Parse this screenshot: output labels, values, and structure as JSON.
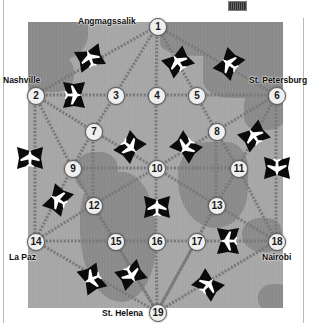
{
  "window": {
    "title": "Airline Route Network Map",
    "background_color": "#ffffff",
    "chip": {
      "name": "toolbar-chip",
      "color": "#4a4a4a"
    }
  },
  "map": {
    "name": "world-map-plate",
    "sea_color": "#9a9a9a",
    "land_color": "#8a8a8a",
    "x": 28,
    "y": 22,
    "width": 255,
    "height": 286
  },
  "graph": {
    "node_fill": "#efefef",
    "node_stroke": "#5d5d5d",
    "edge_color": "#787878",
    "nodes": [
      {
        "id": "1",
        "label": "1",
        "x": 157,
        "y": 26,
        "city": "Angmagssalik",
        "city_x": 78,
        "city_y": 16,
        "city_align": "left"
      },
      {
        "id": "2",
        "label": "2",
        "x": 35,
        "y": 95,
        "city": "Nashville",
        "city_x": 3,
        "city_y": 75,
        "city_align": "left"
      },
      {
        "id": "3",
        "label": "3",
        "x": 115,
        "y": 95,
        "city": "",
        "city_x": 0,
        "city_y": 0,
        "city_align": "left"
      },
      {
        "id": "4",
        "label": "4",
        "x": 156,
        "y": 95,
        "city": "",
        "city_x": 0,
        "city_y": 0,
        "city_align": "left"
      },
      {
        "id": "5",
        "label": "5",
        "x": 196,
        "y": 95,
        "city": "",
        "city_x": 0,
        "city_y": 0,
        "city_align": "left"
      },
      {
        "id": "6",
        "label": "6",
        "x": 276,
        "y": 95,
        "city": "St. Petersburg",
        "city_x": 249,
        "city_y": 75,
        "city_align": "left"
      },
      {
        "id": "7",
        "label": "7",
        "x": 93,
        "y": 131,
        "city": "",
        "city_x": 0,
        "city_y": 0,
        "city_align": "left"
      },
      {
        "id": "8",
        "label": "8",
        "x": 216,
        "y": 131,
        "city": "",
        "city_x": 0,
        "city_y": 0,
        "city_align": "left"
      },
      {
        "id": "9",
        "label": "9",
        "x": 72,
        "y": 168,
        "city": "",
        "city_x": 0,
        "city_y": 0,
        "city_align": "left"
      },
      {
        "id": "10",
        "label": "10",
        "x": 156,
        "y": 168,
        "city": "",
        "city_x": 0,
        "city_y": 0,
        "city_align": "left"
      },
      {
        "id": "11",
        "label": "11",
        "x": 238,
        "y": 168,
        "city": "",
        "city_x": 0,
        "city_y": 0,
        "city_align": "left"
      },
      {
        "id": "12",
        "label": "12",
        "x": 93,
        "y": 205,
        "city": "",
        "city_x": 0,
        "city_y": 0,
        "city_align": "left"
      },
      {
        "id": "13",
        "label": "13",
        "x": 216,
        "y": 205,
        "city": "",
        "city_x": 0,
        "city_y": 0,
        "city_align": "left"
      },
      {
        "id": "14",
        "label": "14",
        "x": 35,
        "y": 241,
        "city": "La Paz",
        "city_x": 9,
        "city_y": 252,
        "city_align": "left"
      },
      {
        "id": "15",
        "label": "15",
        "x": 115,
        "y": 241,
        "city": "",
        "city_x": 0,
        "city_y": 0,
        "city_align": "left"
      },
      {
        "id": "16",
        "label": "16",
        "x": 156,
        "y": 241,
        "city": "",
        "city_x": 0,
        "city_y": 0,
        "city_align": "left"
      },
      {
        "id": "17",
        "label": "17",
        "x": 196,
        "y": 241,
        "city": "",
        "city_x": 0,
        "city_y": 0,
        "city_align": "left"
      },
      {
        "id": "18",
        "label": "18",
        "x": 276,
        "y": 241,
        "city": "Nairobi",
        "city_x": 262,
        "city_y": 252,
        "city_align": "left"
      },
      {
        "id": "19",
        "label": "19",
        "x": 157,
        "y": 312,
        "city": "St. Helena",
        "city_x": 102,
        "city_y": 308,
        "city_align": "left"
      }
    ],
    "edges": [
      [
        "1",
        "2"
      ],
      [
        "1",
        "3"
      ],
      [
        "1",
        "4"
      ],
      [
        "1",
        "5"
      ],
      [
        "1",
        "6"
      ],
      [
        "2",
        "3"
      ],
      [
        "3",
        "4"
      ],
      [
        "4",
        "5"
      ],
      [
        "5",
        "6"
      ],
      [
        "2",
        "7"
      ],
      [
        "2",
        "9"
      ],
      [
        "2",
        "14"
      ],
      [
        "3",
        "7"
      ],
      [
        "5",
        "8"
      ],
      [
        "6",
        "8"
      ],
      [
        "6",
        "11"
      ],
      [
        "6",
        "18"
      ],
      [
        "7",
        "9"
      ],
      [
        "7",
        "10"
      ],
      [
        "7",
        "12"
      ],
      [
        "8",
        "10"
      ],
      [
        "8",
        "11"
      ],
      [
        "8",
        "13"
      ],
      [
        "4",
        "10"
      ],
      [
        "9",
        "10"
      ],
      [
        "10",
        "11"
      ],
      [
        "9",
        "12"
      ],
      [
        "9",
        "14"
      ],
      [
        "11",
        "13"
      ],
      [
        "11",
        "18"
      ],
      [
        "12",
        "14"
      ],
      [
        "12",
        "15"
      ],
      [
        "12",
        "10"
      ],
      [
        "13",
        "10"
      ],
      [
        "13",
        "17"
      ],
      [
        "13",
        "18"
      ],
      [
        "14",
        "15"
      ],
      [
        "15",
        "16"
      ],
      [
        "16",
        "17"
      ],
      [
        "17",
        "18"
      ],
      [
        "10",
        "16"
      ],
      [
        "14",
        "19"
      ],
      [
        "15",
        "19"
      ],
      [
        "16",
        "19"
      ],
      [
        "17",
        "19"
      ],
      [
        "18",
        "19"
      ],
      [
        "12",
        "19"
      ],
      [
        "13",
        "19"
      ]
    ],
    "planes": [
      {
        "name": "plane-icon",
        "x": 90,
        "y": 58,
        "rot": -20
      },
      {
        "name": "plane-icon",
        "x": 74,
        "y": 95,
        "rot": 90
      },
      {
        "name": "plane-icon",
        "x": 178,
        "y": 62,
        "rot": -35
      },
      {
        "name": "plane-icon",
        "x": 229,
        "y": 64,
        "rot": -55
      },
      {
        "name": "plane-icon",
        "x": 254,
        "y": 136,
        "rot": -35
      },
      {
        "name": "plane-icon",
        "x": 130,
        "y": 147,
        "rot": 130
      },
      {
        "name": "plane-icon",
        "x": 186,
        "y": 147,
        "rot": -140
      },
      {
        "name": "plane-icon",
        "x": 30,
        "y": 158,
        "rot": 0
      },
      {
        "name": "plane-icon",
        "x": 277,
        "y": 168,
        "rot": 180
      },
      {
        "name": "plane-icon",
        "x": 58,
        "y": 200,
        "rot": -60
      },
      {
        "name": "plane-icon",
        "x": 157,
        "y": 207,
        "rot": 0
      },
      {
        "name": "plane-icon",
        "x": 228,
        "y": 241,
        "rot": -90
      },
      {
        "name": "plane-icon",
        "x": 92,
        "y": 279,
        "rot": -115
      },
      {
        "name": "plane-icon",
        "x": 131,
        "y": 275,
        "rot": 150
      },
      {
        "name": "plane-icon",
        "x": 208,
        "y": 285,
        "rot": 40
      }
    ]
  }
}
